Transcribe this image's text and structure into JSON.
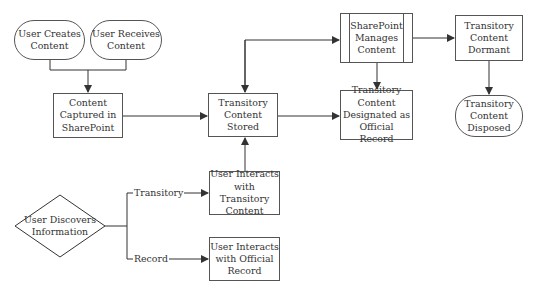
{
  "nodes": {
    "user_creates": "User Creates Content",
    "user_receives": "User Receives Content",
    "content_captured": "Content Captured in SharePoint",
    "transitory_stored": "Transitory Content Stored",
    "sharepoint_manages": "SharePoint Manages Content",
    "designated_record": "Transitory Content Designated as Official Record",
    "dormant": "Transitory Content Dormant",
    "disposed": "Transitory Content Disposed",
    "user_discovers": "User Discovers Information",
    "interacts_transitory": "User Interacts with Transitory Content",
    "interacts_record": "User Interacts with Official Record"
  },
  "edge_labels": {
    "transitory": "Transitory",
    "record": "Record"
  },
  "colors": {
    "line": "#333333",
    "border": "#555555",
    "text": "#333333"
  }
}
